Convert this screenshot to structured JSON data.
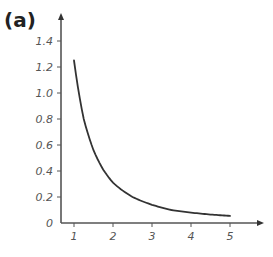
{
  "panel_label": "(a)",
  "chart_data": {
    "type": "line",
    "title": "",
    "xlabel": "",
    "ylabel": "",
    "x_ticks": [
      "1",
      "2",
      "3",
      "4",
      "5"
    ],
    "y_ticks": [
      "0",
      "0.2",
      "0.4",
      "0.6",
      "0.8",
      "1.0",
      "1.2",
      "1.4"
    ],
    "xlim": [
      0.65,
      5.85
    ],
    "ylim": [
      0,
      1.6
    ],
    "grid": false,
    "legend": null,
    "series": [
      {
        "name": "curve",
        "color": "#333333",
        "x": [
          1.0,
          1.25,
          1.5,
          1.75,
          2.0,
          2.5,
          3.0,
          3.5,
          4.0,
          4.5,
          5.0
        ],
        "y": [
          1.25,
          0.8,
          0.56,
          0.41,
          0.31,
          0.2,
          0.14,
          0.1,
          0.08,
          0.065,
          0.055
        ]
      }
    ]
  },
  "colors": {
    "axis": "#555555",
    "curve": "#333333",
    "text": "#555555"
  }
}
